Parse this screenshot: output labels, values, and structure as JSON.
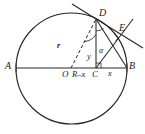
{
  "figure": {
    "kind": "circle-tangent-geometry-diagram",
    "background_color": "#ffffff",
    "stroke_color": "#262626",
    "width": 145,
    "height": 134,
    "points": [
      {
        "id": "A",
        "label": "A",
        "x": 16,
        "y": 68,
        "label_x": 6,
        "label_y": 62
      },
      {
        "id": "B",
        "label": "B",
        "x": 127,
        "y": 68,
        "label_x": 129,
        "label_y": 62
      },
      {
        "id": "O",
        "label": "O",
        "x": 71,
        "y": 68,
        "label_x": 63,
        "label_y": 71
      },
      {
        "id": "C",
        "label": "C",
        "x": 96,
        "y": 68,
        "label_x": 92,
        "label_y": 71
      },
      {
        "id": "D",
        "label": "D",
        "x": 96,
        "y": 19,
        "label_x": 99,
        "label_y": 9
      },
      {
        "id": "E",
        "label": "E",
        "x": 118,
        "y": 33,
        "label_x": 119,
        "label_y": 24
      }
    ],
    "segment_labels": [
      {
        "id": "radius",
        "label": "r",
        "x": 58,
        "y": 43
      },
      {
        "id": "height",
        "label": "y",
        "x": 88,
        "y": 54
      },
      {
        "id": "left-offset",
        "label": "R–x",
        "x": 74,
        "y": 71
      },
      {
        "id": "right-offset",
        "label": "x",
        "x": 108,
        "y": 69
      }
    ],
    "angle_labels": [
      {
        "id": "alpha",
        "label": "α",
        "x": 99,
        "y": 49
      }
    ],
    "circle": {
      "cx": 71.5,
      "cy": 68.5,
      "r": 55.5
    },
    "tangent_line": {
      "x1": 72,
      "y1": 4,
      "x2": 143,
      "y2": 48
    },
    "chord_DB": {
      "x1": 96,
      "y1": 19,
      "x2": 127,
      "y2": 68
    },
    "chord_CE": {
      "x1": 96,
      "y1": 68,
      "x2": 132,
      "y2": 20
    },
    "radius_OD_dashed": {
      "x1": 71,
      "y1": 68,
      "x2": 96,
      "y2": 19
    },
    "altitude_DC": {
      "x1": 96,
      "y1": 19,
      "x2": 96,
      "y2": 68
    },
    "diameter_AB": {
      "x1": 16,
      "y1": 68,
      "x2": 127,
      "y2": 68
    }
  }
}
